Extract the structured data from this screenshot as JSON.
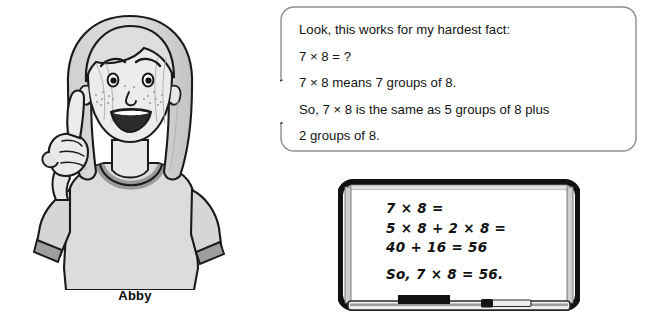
{
  "character": {
    "name_label": "Abby",
    "description": "cartoon-girl-pointing-finger",
    "hair_color": "#d9d9d9",
    "skin_color": "#e9e9e9",
    "shirt_color": "#dcdcdc",
    "trim_color": "#9a9a9a",
    "outline_color": "#1a1a1a"
  },
  "speech_bubble": {
    "border_color": "#8d8d8d",
    "fill_color": "#ffffff",
    "lines": [
      "Look, this works for my hardest fact:",
      "7 × 8 = ?",
      "7 × 8 means 7 groups of 8.",
      "So, 7 × 8 is the same as 5 groups of 8 plus",
      "2 groups of 8."
    ]
  },
  "whiteboard": {
    "frame_color": "#111111",
    "bezel_color": "#c9c9c9",
    "surface_color": "#ffffff",
    "lines": [
      "7 × 8 =",
      "5 × 8 + 2 × 8 =",
      "40 + 16 = 56",
      "So, 7 × 8 = 56."
    ],
    "tray": {
      "eraser_label": "eraser",
      "marker_label": "marker"
    }
  }
}
